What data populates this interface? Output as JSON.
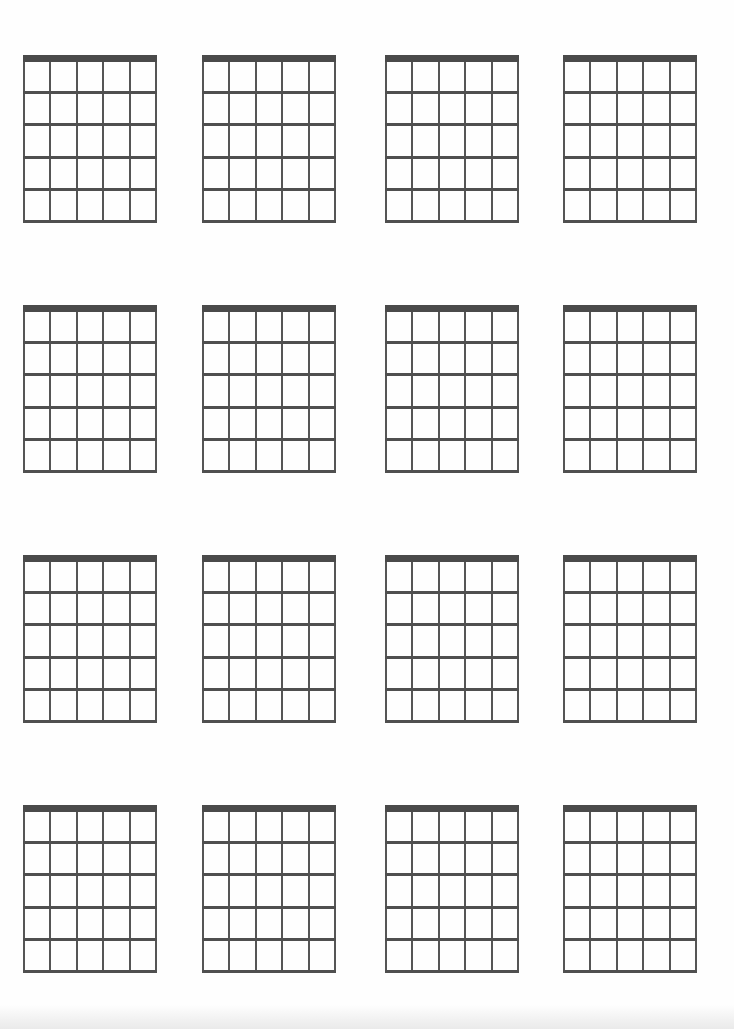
{
  "page": {
    "type": "blank guitar chord chart sheet",
    "background": "#fefefe",
    "line_color": "#555555",
    "nut_color": "#4a4a4a"
  },
  "grid": {
    "rows": 4,
    "columns": 4,
    "column_x": [
      23,
      202,
      385,
      563
    ],
    "row_y": [
      55,
      305,
      555,
      805
    ]
  },
  "diagram": {
    "width": 134,
    "height": 168,
    "strings": 6,
    "fret_spaces": 5,
    "nut_height": 7
  },
  "diagrams": [
    {
      "id": 1,
      "row": 1,
      "col": 1,
      "label": ""
    },
    {
      "id": 2,
      "row": 1,
      "col": 2,
      "label": ""
    },
    {
      "id": 3,
      "row": 1,
      "col": 3,
      "label": ""
    },
    {
      "id": 4,
      "row": 1,
      "col": 4,
      "label": ""
    },
    {
      "id": 5,
      "row": 2,
      "col": 1,
      "label": ""
    },
    {
      "id": 6,
      "row": 2,
      "col": 2,
      "label": ""
    },
    {
      "id": 7,
      "row": 2,
      "col": 3,
      "label": ""
    },
    {
      "id": 8,
      "row": 2,
      "col": 4,
      "label": ""
    },
    {
      "id": 9,
      "row": 3,
      "col": 1,
      "label": ""
    },
    {
      "id": 10,
      "row": 3,
      "col": 2,
      "label": ""
    },
    {
      "id": 11,
      "row": 3,
      "col": 3,
      "label": ""
    },
    {
      "id": 12,
      "row": 3,
      "col": 4,
      "label": ""
    },
    {
      "id": 13,
      "row": 4,
      "col": 1,
      "label": ""
    },
    {
      "id": 14,
      "row": 4,
      "col": 2,
      "label": ""
    },
    {
      "id": 15,
      "row": 4,
      "col": 3,
      "label": ""
    },
    {
      "id": 16,
      "row": 4,
      "col": 4,
      "label": ""
    }
  ]
}
